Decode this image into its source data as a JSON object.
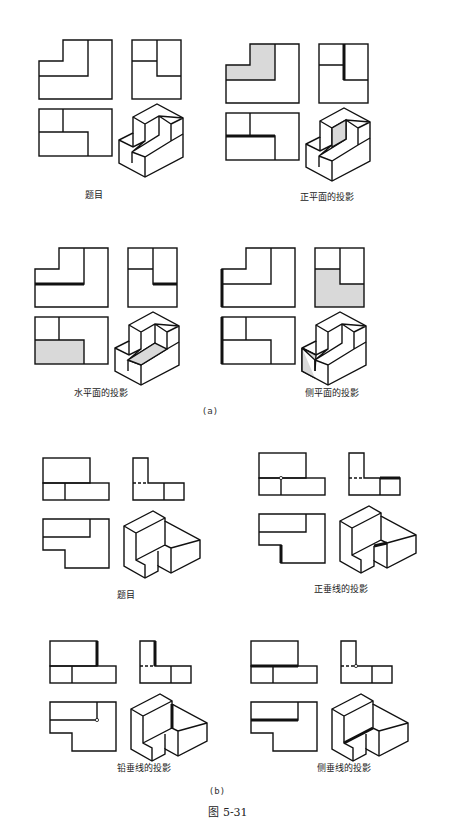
{
  "part_a": {
    "label": "(a)",
    "panels": [
      {
        "id": "a1",
        "caption": "题目"
      },
      {
        "id": "a2",
        "caption": "正平面的投影"
      },
      {
        "id": "a3",
        "caption": "水平面的投影"
      },
      {
        "id": "a4",
        "caption": "侧平面的投影"
      }
    ]
  },
  "part_b": {
    "label": "(b)",
    "panels": [
      {
        "id": "b1",
        "caption": "题目"
      },
      {
        "id": "b2",
        "caption": "正垂线的投影"
      },
      {
        "id": "b3",
        "caption": "铅垂线的投影"
      },
      {
        "id": "b4",
        "caption": "侧垂线的投影"
      }
    ]
  },
  "figure_label": "图 5-31",
  "colors": {
    "line": "#111111",
    "highlight_fill": "#d9d9d9",
    "background": "#ffffff"
  }
}
